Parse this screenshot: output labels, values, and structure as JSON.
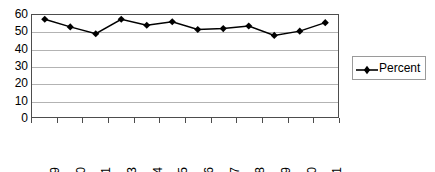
{
  "chart_data": {
    "type": "line",
    "title": "",
    "xlabel": "",
    "ylabel": "",
    "categories": [
      "1999",
      "2000",
      "2001",
      "2003",
      "2004",
      "2005",
      "2006",
      "2007",
      "2008",
      "2009",
      "2010",
      "2011"
    ],
    "series": [
      {
        "name": "Percent",
        "values": [
          57.5,
          53.0,
          49.0,
          57.5,
          54.0,
          56.0,
          51.5,
          52.0,
          53.5,
          48.0,
          50.5,
          55.5
        ],
        "color": "#000000",
        "marker": "diamond"
      }
    ],
    "ylim": [
      0,
      60
    ],
    "yticks": [
      60,
      50,
      40,
      30,
      20,
      10,
      0
    ],
    "ytick_labels": [
      "60",
      "50",
      "40",
      "30",
      "20",
      "10",
      "0"
    ],
    "grid": "horizontal",
    "legend_position": "right",
    "legend_entries": [
      "Percent"
    ]
  },
  "legend": {
    "label": "Percent",
    "marker_icon": "diamond-marker-icon"
  },
  "colors": {
    "series": "#000000",
    "gridline": "#b3b3b3",
    "axis": "#4d4d4d",
    "background": "#ffffff",
    "legend_border": "#9a9a9a"
  }
}
